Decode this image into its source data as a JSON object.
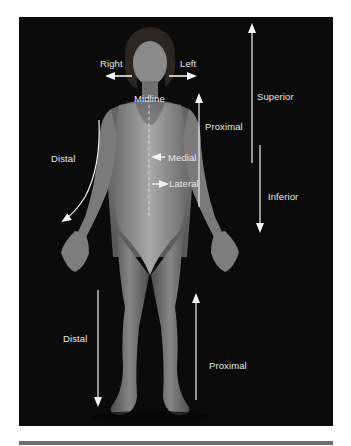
{
  "figure": {
    "colors": {
      "background": "#0b0b0b",
      "label": "#e8e8e8",
      "arrow": "#f2f2f2",
      "rule": "#6e6e6e"
    },
    "labels": {
      "right": "Right",
      "left": "Left",
      "midline": "Midline",
      "proximal_arm": "Proximal",
      "superior": "Superior",
      "distal_arm": "Distal",
      "medial": "Medial",
      "lateral": "Lateral",
      "inferior": "Inferior",
      "distal_leg": "Distal",
      "proximal_leg": "Proximal"
    },
    "arrows": [
      {
        "name": "right-arrow",
        "direction": "left"
      },
      {
        "name": "left-arrow",
        "direction": "right"
      },
      {
        "name": "superior-arrow",
        "direction": "up"
      },
      {
        "name": "inferior-arrow",
        "direction": "down"
      },
      {
        "name": "proximal-arm-arrow",
        "direction": "up"
      },
      {
        "name": "distal-arm-arrow",
        "direction": "down-left"
      },
      {
        "name": "medial-arrow",
        "direction": "left"
      },
      {
        "name": "lateral-arrow",
        "direction": "right"
      },
      {
        "name": "distal-leg-arrow",
        "direction": "down"
      },
      {
        "name": "proximal-leg-arrow",
        "direction": "up"
      }
    ]
  }
}
